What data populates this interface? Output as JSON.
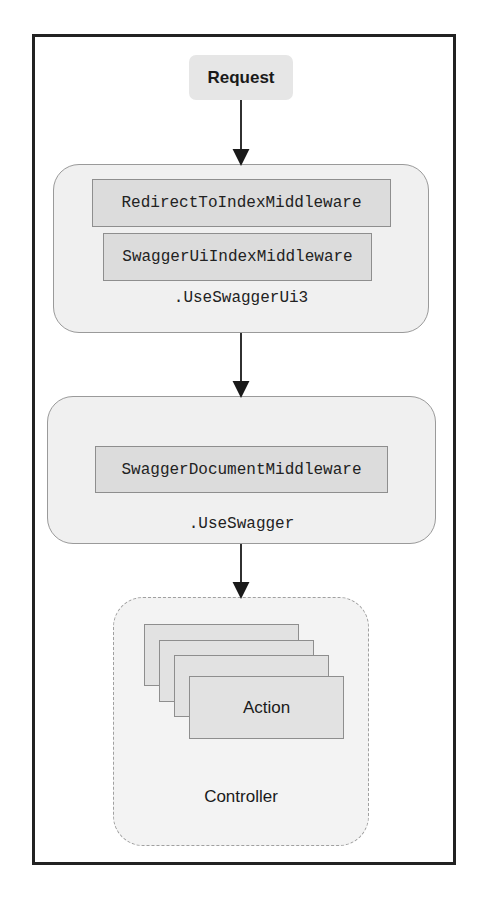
{
  "diagram": {
    "request": {
      "label": "Request"
    },
    "swagger_ui_group": {
      "label": ".UseSwaggerUi3",
      "middlewares": [
        {
          "label": "RedirectToIndexMiddleware"
        },
        {
          "label": "SwaggerUiIndexMiddleware"
        }
      ]
    },
    "swagger_group": {
      "label": ".UseSwagger",
      "middlewares": [
        {
          "label": "SwaggerDocumentMiddleware"
        }
      ]
    },
    "controller": {
      "label": "Controller",
      "action": {
        "label": "Action"
      },
      "stacked_action_count": 4
    },
    "arrows": [
      {
        "from": "Request",
        "to": ".UseSwaggerUi3"
      },
      {
        "from": ".UseSwaggerUi3",
        "to": ".UseSwagger"
      },
      {
        "from": ".UseSwagger",
        "to": "Controller"
      }
    ],
    "colors": {
      "frame_border": "#222222",
      "group_fill": "#f0f0f0",
      "middleware_fill": "#dcdcdc",
      "request_fill": "#e6e6e6",
      "arrow": "#1a1a1a"
    }
  }
}
